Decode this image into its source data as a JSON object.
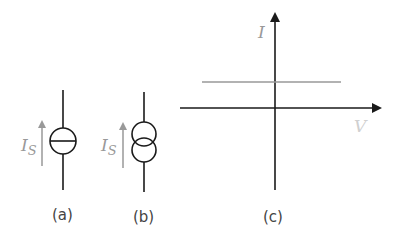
{
  "panels": {
    "a": {
      "caption": "(a)",
      "current_label": "I",
      "current_subscript": "S",
      "symbol": "current-source-circle-with-bar"
    },
    "b": {
      "caption": "(b)",
      "current_label": "I",
      "current_subscript": "S",
      "symbol": "current-source-double-circle"
    },
    "c": {
      "caption": "(c)",
      "y_axis_label": "I",
      "x_axis_label": "V",
      "plot": "constant-current-iv-characteristic"
    }
  },
  "colors": {
    "line": "#1a1a1a",
    "accent_gray": "#999999"
  }
}
